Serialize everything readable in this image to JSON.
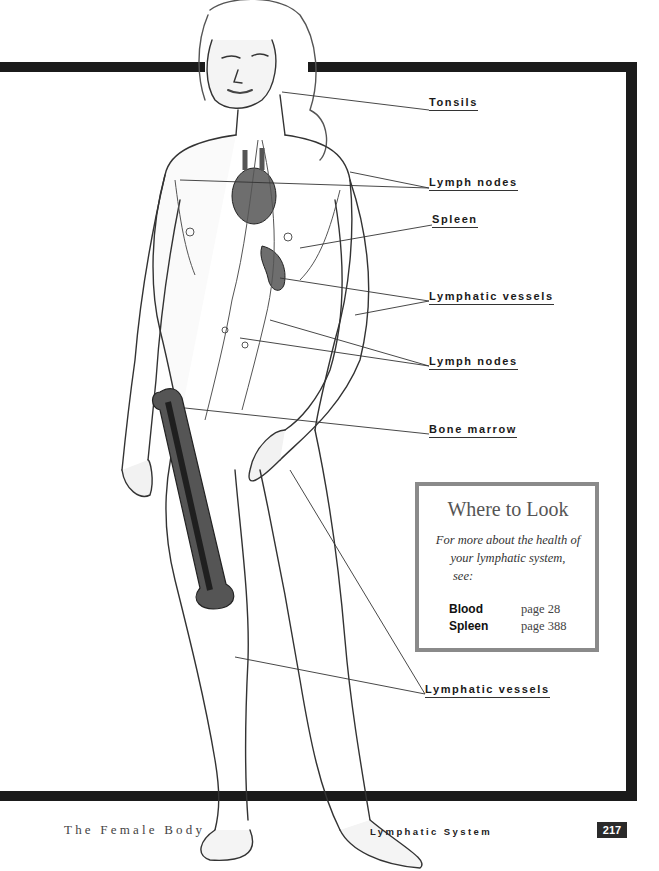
{
  "illustration": {
    "subject": "Female figure showing the lymphatic system",
    "labels": [
      {
        "text": "Tonsils",
        "x": 429,
        "y": 96
      },
      {
        "text": "Lymph nodes",
        "x": 429,
        "y": 176
      },
      {
        "text": "Spleen",
        "x": 432,
        "y": 213
      },
      {
        "text": "Lymphatic vessels",
        "x": 429,
        "y": 290
      },
      {
        "text": "Lymph nodes",
        "x": 429,
        "y": 355
      },
      {
        "text": "Bone marrow",
        "x": 429,
        "y": 423
      },
      {
        "text": "Lymphatic vessels",
        "x": 425,
        "y": 683
      }
    ]
  },
  "sidebar_box": {
    "title": "Where to Look",
    "intro_line1": "For more about the health of",
    "intro_line2": "your lymphatic system,",
    "intro_line3": "see:",
    "references": [
      {
        "topic": "Blood",
        "page": "page 28"
      },
      {
        "topic": "Spleen",
        "page": "page 388"
      }
    ]
  },
  "footer": {
    "book_title": "The Female Body",
    "chapter_title": "Lymphatic System",
    "page_number": "217"
  },
  "colors": {
    "frame": "#1b1b1b",
    "box_border": "#8a8a8a",
    "organ_fill": "#6e6e6e",
    "badge": "#2a2a2a"
  }
}
